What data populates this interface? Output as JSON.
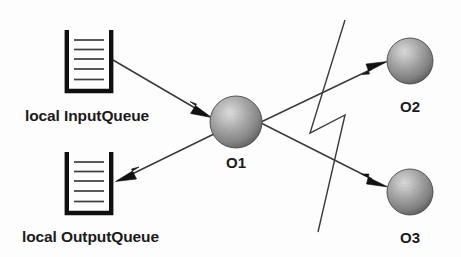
{
  "diagram": {
    "background_color": "#fdfdfd",
    "line_color": "#3a3a3a",
    "arrow_color": "#111111",
    "queue_border_color": "#101010",
    "sphere_light_color": "#d8d8d8",
    "sphere_mid_color": "#9a9a9a",
    "sphere_dark_color": "#5a5a5a",
    "nodes": [
      {
        "id": "o1",
        "label": "O1",
        "shape": "sphere",
        "cx": 236,
        "cy": 122,
        "r": 26,
        "label_x": 236,
        "label_y": 168
      },
      {
        "id": "o2",
        "label": "O2",
        "shape": "sphere",
        "cx": 410,
        "cy": 61,
        "r": 23,
        "label_x": 410,
        "label_y": 112
      },
      {
        "id": "o3",
        "label": "O3",
        "shape": "sphere",
        "cx": 410,
        "cy": 192,
        "r": 23,
        "label_x": 410,
        "label_y": 243
      }
    ],
    "queues": [
      {
        "id": "input-queue",
        "label": "local InputQueue",
        "x": 65,
        "y": 30,
        "width": 48,
        "height": 63,
        "line_count": 5,
        "label_x": 25,
        "label_y": 120
      },
      {
        "id": "output-queue",
        "label": "local OutputQueue",
        "x": 65,
        "y": 152,
        "width": 48,
        "height": 63,
        "line_count": 5,
        "label_x": 22,
        "label_y": 241
      }
    ],
    "edges": [
      {
        "id": "input-to-o1",
        "from": "input-queue",
        "to": "o1",
        "direction": "right-down",
        "from_x": 113,
        "from_y": 60,
        "to_x": 211,
        "to_y": 117
      },
      {
        "id": "o1-to-output",
        "from": "o1",
        "to": "output-queue",
        "direction": "left-down",
        "from_x": 214,
        "from_y": 132,
        "to_x": 117,
        "to_y": 180
      },
      {
        "id": "o1-to-o2",
        "from": "o1",
        "to": "o2",
        "direction": "right-up",
        "from_x": 262,
        "from_y": 122,
        "to_x": 387,
        "to_y": 62
      },
      {
        "id": "o1-to-o3",
        "from": "o1",
        "to": "o3",
        "direction": "right-down",
        "from_x": 262,
        "from_y": 122,
        "to_x": 387,
        "to_y": 186
      }
    ],
    "decorations": [
      {
        "id": "lightning-bolt",
        "name": "lightning-bolt",
        "points": "345,20 310,133 345,115 318,232"
      }
    ]
  }
}
